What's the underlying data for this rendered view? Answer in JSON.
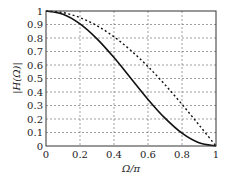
{
  "chart_data": {
    "type": "line",
    "title": "",
    "xlabel": "Ω/π",
    "ylabel": "|H(Ω)|",
    "xlim": [
      0,
      1
    ],
    "ylim": [
      0,
      1
    ],
    "grid": true,
    "legend": null,
    "x_ticks": [
      "0",
      "0.2",
      "0.4",
      "0.6",
      "0.8",
      "1"
    ],
    "y_ticks": [
      "0",
      "0.1",
      "0.2",
      "0.3",
      "0.4",
      "0.5",
      "0.6",
      "0.7",
      "0.8",
      "0.9",
      "1"
    ],
    "x": [
      0,
      0.1,
      0.2,
      0.3,
      0.4,
      0.5,
      0.6,
      0.7,
      0.8,
      0.9,
      1.0
    ],
    "series": [
      {
        "name": "solid",
        "style": "solid",
        "color": "#111111",
        "values": [
          1.0,
          0.976,
          0.905,
          0.794,
          0.655,
          0.5,
          0.345,
          0.206,
          0.095,
          0.024,
          0.0
        ]
      },
      {
        "name": "dashed",
        "style": "dashed",
        "color": "#111111",
        "values": [
          1.0,
          0.988,
          0.951,
          0.891,
          0.809,
          0.707,
          0.588,
          0.454,
          0.309,
          0.156,
          0.0
        ]
      }
    ]
  }
}
